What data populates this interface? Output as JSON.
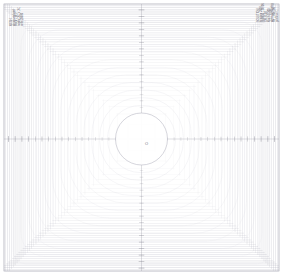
{
  "figure": {
    "title": "",
    "background_color": "#ffffff",
    "frame_color": "#b9b9c4",
    "mesh_color": "#c2c2cc",
    "mesh_color_dense": "#a9a9b6",
    "contour_color": "#c9c9d4",
    "axis_color": "#8a8a98",
    "tick_color": "#6e6e7c",
    "circle_color": "#b0b0bd",
    "text_color": "#5a5a66"
  },
  "annotations": {
    "top_left": "MESH\nstructured grid\nblock 1 of 1\nnodes 161 x 161\ncells 25600",
    "top_right": "SOLUTION\niteration 2000\nresidual 1.0e-06\nCFL 0.50\nMach 0.300\nalpha 0.000 deg\nRe 1.00e+06\ngrid level 1"
  },
  "axes": {
    "x_label": "x",
    "y_label": "y",
    "x_range": [
      -1.0,
      1.0
    ],
    "y_range": [
      -1.0,
      1.0
    ],
    "center_label": "O",
    "x_center_px": 141.5,
    "y_center_px": 139.0,
    "tick_count_per_side": 17,
    "tick_inner_gap_px": 26,
    "tick_outer_px": 133,
    "axis_half_len_px": 136
  },
  "geometry": {
    "domain_left_px": 4,
    "domain_top_px": 4,
    "domain_width_px": 275,
    "domain_height_px": 267,
    "hole_radius_px": 26,
    "mesh_lines_per_axis": 81,
    "contour_bands": 14,
    "dense_edge_fraction": 0.3
  },
  "chart_data": {
    "type": "heatmap",
    "title": "",
    "subtitle": "",
    "xlabel": "x",
    "ylabel": "y",
    "xlim": [
      -1.0,
      1.0
    ],
    "ylim": [
      -1.0,
      1.0
    ],
    "grid": true,
    "legend": "none",
    "x": [
      -1.0,
      -0.875,
      -0.75,
      -0.625,
      -0.5,
      -0.375,
      -0.25,
      -0.125,
      0.0,
      0.125,
      0.25,
      0.375,
      0.5,
      0.625,
      0.75,
      0.875,
      1.0
    ],
    "y": [
      -1.0,
      -0.875,
      -0.75,
      -0.625,
      -0.5,
      -0.375,
      -0.25,
      -0.125,
      0.0,
      0.125,
      0.25,
      0.375,
      0.5,
      0.625,
      0.75,
      0.875,
      1.0
    ],
    "contour_levels": [
      0.19,
      0.26,
      0.33,
      0.4,
      0.47,
      0.54,
      0.61,
      0.68,
      0.75,
      0.82,
      0.89,
      0.96,
      1.03,
      1.1
    ],
    "series": [
      {
        "name": "mesh-density-radial",
        "x": [
          0.19,
          0.3,
          0.42,
          0.54,
          0.66,
          0.78,
          0.9,
          1.0
        ],
        "values": [
          1.0,
          1.2,
          1.6,
          2.3,
          3.4,
          5.2,
          8.1,
          12.0
        ]
      }
    ]
  }
}
